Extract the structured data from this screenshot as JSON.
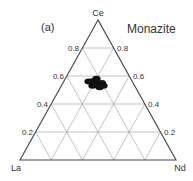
{
  "panel_label": "(a)",
  "title": "Monazite",
  "vertices": {
    "top": "Ce",
    "left": "La",
    "right": "Nd"
  },
  "tick_labels_left": [
    "0.8",
    "0.6",
    "0.4",
    "0.2"
  ],
  "tick_labels_right": [
    "0.8",
    "0.6",
    "0.4",
    "0.2"
  ],
  "chart_data": {
    "type": "scatter",
    "subtype": "ternary",
    "title": "Monazite",
    "panel": "(a)",
    "axes": {
      "top": "Ce",
      "bottom_left": "La",
      "bottom_right": "Nd"
    },
    "ticks": [
      0.2,
      0.4,
      0.6,
      0.8
    ],
    "grid": true,
    "series": [
      {
        "name": "Monazite analyses",
        "marker": "filled cluster",
        "approx_points": [
          {
            "Ce": 0.56,
            "La": 0.26,
            "Nd": 0.18
          },
          {
            "Ce": 0.55,
            "La": 0.24,
            "Nd": 0.21
          },
          {
            "Ce": 0.54,
            "La": 0.25,
            "Nd": 0.21
          },
          {
            "Ce": 0.57,
            "La": 0.23,
            "Nd": 0.2
          },
          {
            "Ce": 0.53,
            "La": 0.27,
            "Nd": 0.2
          },
          {
            "Ce": 0.55,
            "La": 0.2,
            "Nd": 0.25
          },
          {
            "Ce": 0.53,
            "La": 0.2,
            "Nd": 0.27
          },
          {
            "Ce": 0.56,
            "La": 0.28,
            "Nd": 0.16
          },
          {
            "Ce": 0.58,
            "La": 0.22,
            "Nd": 0.2
          },
          {
            "Ce": 0.52,
            "La": 0.23,
            "Nd": 0.25
          }
        ]
      }
    ]
  }
}
